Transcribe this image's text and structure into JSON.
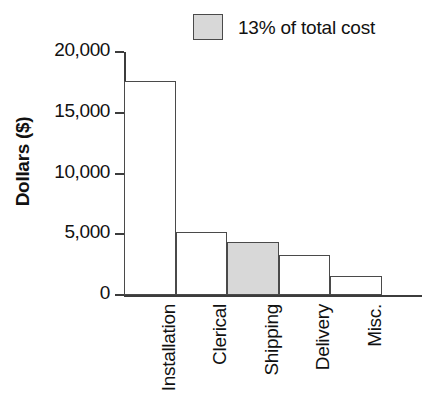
{
  "chart_data": {
    "type": "bar",
    "title": "",
    "subtitle": "",
    "xlabel": "",
    "ylabel": "Dollars ($)",
    "categories": [
      "Installation",
      "Clerical",
      "Shipping",
      "Delivery",
      "Misc."
    ],
    "values": [
      17600,
      5200,
      4350,
      3260,
      1590
    ],
    "ylim": [
      0,
      20000
    ],
    "yticks": [
      0,
      5000,
      10000,
      15000,
      20000
    ],
    "ytick_labels": [
      "0",
      "5,000",
      "10,000",
      "15,000",
      "20,000"
    ],
    "grid": false,
    "legend_position": "top-center",
    "legend": [
      {
        "label": "13% of total cost",
        "swatch_color": "#d8d8d8",
        "applies_to_category": "Shipping"
      }
    ],
    "bar_fill_default": "#ffffff",
    "bar_edge_color": "#4a4a4a",
    "highlight_fill": "#d8d8d8",
    "highlighted_categories": [
      "Shipping"
    ],
    "annotations": []
  }
}
